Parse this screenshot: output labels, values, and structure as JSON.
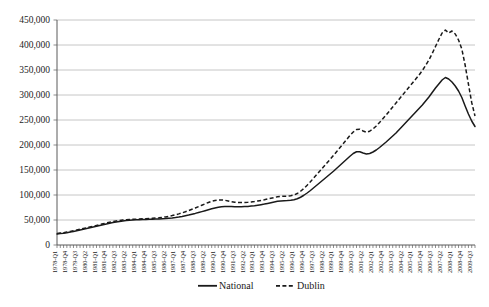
{
  "chart_data": {
    "type": "line",
    "title": "",
    "xlabel": "",
    "ylabel": "",
    "ylim": [
      0,
      450000
    ],
    "ytick_step": 50000,
    "ytick_labels": [
      "0",
      "50,000",
      "100,000",
      "150,000",
      "200,000",
      "250,000",
      "300,000",
      "350,000",
      "400,000",
      "450,000"
    ],
    "ytick_values": [
      0,
      50000,
      100000,
      150000,
      200000,
      250000,
      300000,
      350000,
      400000,
      450000
    ],
    "grid": true,
    "legend_position": "bottom-center",
    "x_tick_label_rotation": -90,
    "x_tick_label_interval": 3,
    "x": [
      "1978-Q1",
      "1978-Q2",
      "1978-Q3",
      "1978-Q4",
      "1979-Q1",
      "1979-Q2",
      "1979-Q3",
      "1979-Q4",
      "1980-Q1",
      "1980-Q2",
      "1980-Q3",
      "1980-Q4",
      "1981-Q1",
      "1981-Q2",
      "1981-Q3",
      "1981-Q4",
      "1982-Q1",
      "1982-Q2",
      "1982-Q3",
      "1982-Q4",
      "1983-Q1",
      "1983-Q2",
      "1983-Q3",
      "1983-Q4",
      "1984-Q1",
      "1984-Q2",
      "1984-Q3",
      "1984-Q4",
      "1985-Q1",
      "1985-Q2",
      "1985-Q3",
      "1985-Q4",
      "1986-Q1",
      "1986-Q2",
      "1986-Q3",
      "1986-Q4",
      "1987-Q1",
      "1987-Q2",
      "1987-Q3",
      "1987-Q4",
      "1988-Q1",
      "1988-Q2",
      "1988-Q3",
      "1988-Q4",
      "1989-Q1",
      "1989-Q2",
      "1989-Q3",
      "1989-Q4",
      "1990-Q1",
      "1990-Q2",
      "1990-Q3",
      "1990-Q4",
      "1991-Q1",
      "1991-Q2",
      "1991-Q3",
      "1991-Q4",
      "1992-Q1",
      "1992-Q2",
      "1992-Q3",
      "1992-Q4",
      "1993-Q1",
      "1993-Q2",
      "1993-Q3",
      "1993-Q4",
      "1994-Q1",
      "1994-Q2",
      "1994-Q3",
      "1994-Q4",
      "1995-Q1",
      "1995-Q2",
      "1995-Q3",
      "1995-Q4",
      "1996-Q1",
      "1996-Q2",
      "1996-Q3",
      "1996-Q4",
      "1997-Q1",
      "1997-Q2",
      "1997-Q3",
      "1997-Q4",
      "1998-Q1",
      "1998-Q2",
      "1998-Q3",
      "1998-Q4",
      "1999-Q1",
      "1999-Q2",
      "1999-Q3",
      "1999-Q4",
      "2000-Q1",
      "2000-Q2",
      "2000-Q3",
      "2000-Q4",
      "2001-Q1",
      "2001-Q2",
      "2001-Q3",
      "2001-Q4",
      "2002-Q1",
      "2002-Q2",
      "2002-Q3",
      "2002-Q4",
      "2003-Q1",
      "2003-Q2",
      "2003-Q3",
      "2003-Q4",
      "2004-Q1",
      "2004-Q2",
      "2004-Q3",
      "2004-Q4",
      "2005-Q1",
      "2005-Q2",
      "2005-Q3",
      "2005-Q4",
      "2006-Q1",
      "2006-Q2",
      "2006-Q3",
      "2006-Q4",
      "2007-Q1",
      "2007-Q2",
      "2007-Q3",
      "2007-Q4",
      "2008-Q1",
      "2008-Q2",
      "2008-Q3",
      "2008-Q4",
      "2009-Q1",
      "2009-Q2",
      "2009-Q3",
      "2009-Q4"
    ],
    "series": [
      {
        "name": "National",
        "style": "solid",
        "values": [
          22000,
          22800,
          23600,
          24600,
          25800,
          27200,
          28600,
          30000,
          31500,
          33000,
          34500,
          36000,
          37500,
          39000,
          40500,
          42000,
          43500,
          44800,
          46000,
          47000,
          48000,
          48800,
          49500,
          50000,
          50400,
          50700,
          51000,
          51200,
          51400,
          51600,
          51900,
          52200,
          52600,
          53000,
          53600,
          54200,
          55000,
          56000,
          57200,
          58600,
          60000,
          61600,
          63200,
          65000,
          66800,
          68600,
          70500,
          72400,
          74000,
          75500,
          76500,
          77000,
          77000,
          76800,
          76500,
          76400,
          76500,
          76800,
          77200,
          77800,
          78500,
          79500,
          80600,
          81800,
          83200,
          84600,
          86000,
          87500,
          88200,
          88500,
          88800,
          89500,
          90500,
          92500,
          95500,
          99500,
          104000,
          109000,
          114500,
          120000,
          125500,
          131000,
          136500,
          142000,
          147500,
          153500,
          159500,
          165500,
          171500,
          177500,
          183000,
          186500,
          186500,
          184000,
          182000,
          183000,
          186000,
          190000,
          195000,
          200500,
          206000,
          212000,
          218000,
          224000,
          231000,
          238000,
          245000,
          252000,
          259000,
          266000,
          273000,
          280000,
          288000,
          296000,
          305000,
          314000,
          322000,
          330000,
          335000,
          332000,
          326000,
          318000,
          308000,
          295000,
          278000,
          262000,
          248000,
          237000
        ]
      },
      {
        "name": "Dublin",
        "style": "dashed",
        "values": [
          23000,
          23800,
          24700,
          25800,
          27000,
          28400,
          29900,
          31400,
          33000,
          34500,
          36000,
          37600,
          39200,
          40800,
          42400,
          44000,
          45500,
          46800,
          48000,
          49000,
          49800,
          50400,
          51000,
          51400,
          51700,
          52000,
          52300,
          52600,
          52900,
          53300,
          53800,
          54400,
          55200,
          56200,
          57400,
          58800,
          60400,
          62200,
          64200,
          66400,
          68800,
          71400,
          74000,
          76800,
          79600,
          82400,
          85000,
          87400,
          89000,
          90000,
          90200,
          89500,
          88000,
          86500,
          85500,
          85000,
          85000,
          85200,
          85600,
          86200,
          87000,
          88000,
          89200,
          90500,
          92000,
          93500,
          95000,
          96500,
          97200,
          97500,
          97800,
          98500,
          100000,
          103000,
          107500,
          113000,
          119500,
          126500,
          134000,
          141500,
          149000,
          156500,
          164000,
          171500,
          179000,
          187000,
          195000,
          203000,
          211000,
          219000,
          226000,
          231000,
          231500,
          228000,
          225500,
          227500,
          232000,
          238000,
          245000,
          252500,
          260000,
          268000,
          276000,
          284000,
          292000,
          300000,
          308000,
          316000,
          324000,
          332000,
          340000,
          349000,
          359000,
          370000,
          383000,
          397000,
          411000,
          424000,
          430000,
          424000,
          428000,
          422000,
          410000,
          392000,
          360000,
          322000,
          285000,
          258000
        ]
      }
    ]
  },
  "legend": {
    "entries": [
      {
        "label": "National",
        "marker": "solid-line"
      },
      {
        "label": "Dublin",
        "marker": "dashed-line"
      }
    ]
  }
}
